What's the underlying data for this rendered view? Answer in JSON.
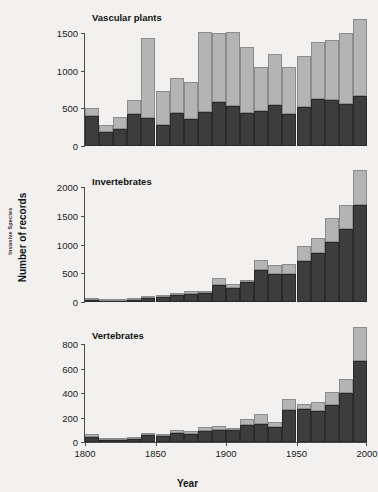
{
  "figure": {
    "ylabel_outer": "Invasive Species",
    "ylabel_main": "Number of records",
    "xlabel": "Year",
    "colors": {
      "background": "#f2f1ef",
      "established": "#3d3d3d",
      "casual": "#b4b4b4",
      "axis": "#4a4a4a"
    }
  },
  "chart_data": [
    {
      "type": "bar",
      "title": "Vascular plants",
      "stacked": true,
      "xlabel": "Year",
      "ylabel": "Number of records",
      "xlim": [
        1800,
        2000
      ],
      "ylim": [
        0,
        1700
      ],
      "yticks": [
        0,
        500,
        1000,
        1500
      ],
      "xticks": [
        1800,
        1850,
        1900,
        1950,
        2000
      ],
      "grid": false,
      "legend": "none",
      "categories": [
        1800,
        1810,
        1820,
        1830,
        1840,
        1850,
        1860,
        1870,
        1880,
        1890,
        1900,
        1910,
        1920,
        1930,
        1940,
        1950,
        1960,
        1970,
        1980,
        1990
      ],
      "series": [
        {
          "name": "dark",
          "values": [
            405,
            185,
            225,
            420,
            375,
            280,
            440,
            365,
            450,
            590,
            530,
            445,
            465,
            540,
            425,
            520,
            620,
            605,
            560,
            665
          ]
        },
        {
          "name": "light",
          "values": [
            95,
            100,
            165,
            195,
            1060,
            455,
            465,
            485,
            1060,
            915,
            985,
            875,
            580,
            680,
            625,
            680,
            755,
            800,
            935,
            1025
          ]
        }
      ],
      "totals": [
        500,
        285,
        390,
        615,
        1435,
        735,
        905,
        850,
        1510,
        1505,
        1515,
        1320,
        1045,
        1220,
        1050,
        1200,
        1375,
        1405,
        1495,
        1690
      ]
    },
    {
      "type": "bar",
      "title": "Invertebrates",
      "stacked": true,
      "xlabel": "Year",
      "ylabel": "Number of records",
      "xlim": [
        1800,
        2000
      ],
      "ylim": [
        0,
        2300
      ],
      "yticks": [
        0,
        500,
        1000,
        1500,
        2000
      ],
      "xticks": [
        1800,
        1850,
        1900,
        1950,
        2000
      ],
      "grid": false,
      "legend": "none",
      "categories": [
        1800,
        1810,
        1820,
        1830,
        1840,
        1850,
        1860,
        1870,
        1880,
        1890,
        1900,
        1910,
        1920,
        1930,
        1940,
        1950,
        1960,
        1970,
        1980,
        1990
      ],
      "series": [
        {
          "name": "dark",
          "values": [
            30,
            15,
            25,
            40,
            65,
            90,
            115,
            140,
            155,
            305,
            250,
            350,
            560,
            485,
            490,
            720,
            850,
            1040,
            1265,
            1690
          ]
        },
        {
          "name": "light",
          "values": [
            10,
            10,
            15,
            15,
            30,
            20,
            25,
            50,
            25,
            110,
            60,
            30,
            165,
            160,
            180,
            250,
            265,
            420,
            430,
            605
          ]
        }
      ],
      "totals": [
        40,
        25,
        40,
        55,
        95,
        110,
        140,
        190,
        180,
        415,
        310,
        380,
        725,
        645,
        670,
        970,
        1115,
        1460,
        1695,
        2295
      ]
    },
    {
      "type": "bar",
      "title": "Vertebrates",
      "stacked": true,
      "xlabel": "Year",
      "ylabel": "Number of records",
      "xlim": [
        1800,
        2000
      ],
      "ylim": [
        0,
        950
      ],
      "yticks": [
        0,
        200,
        400,
        600,
        800
      ],
      "xticks": [
        1800,
        1850,
        1900,
        1950,
        2000
      ],
      "grid": false,
      "legend": "none",
      "categories": [
        1800,
        1810,
        1820,
        1830,
        1840,
        1850,
        1860,
        1870,
        1880,
        1890,
        1900,
        1910,
        1920,
        1930,
        1940,
        1950,
        1960,
        1970,
        1980,
        1990
      ],
      "series": [
        {
          "name": "dark",
          "values": [
            45,
            15,
            15,
            25,
            60,
            50,
            75,
            65,
            90,
            95,
            100,
            140,
            150,
            125,
            265,
            270,
            255,
            300,
            400,
            665
          ]
        },
        {
          "name": "light",
          "values": [
            20,
            5,
            5,
            10,
            5,
            10,
            25,
            25,
            30,
            35,
            15,
            50,
            80,
            35,
            85,
            45,
            70,
            110,
            120,
            275
          ]
        }
      ],
      "totals": [
        65,
        20,
        20,
        35,
        65,
        60,
        100,
        90,
        120,
        130,
        115,
        190,
        230,
        160,
        350,
        315,
        325,
        410,
        520,
        940
      ]
    }
  ]
}
